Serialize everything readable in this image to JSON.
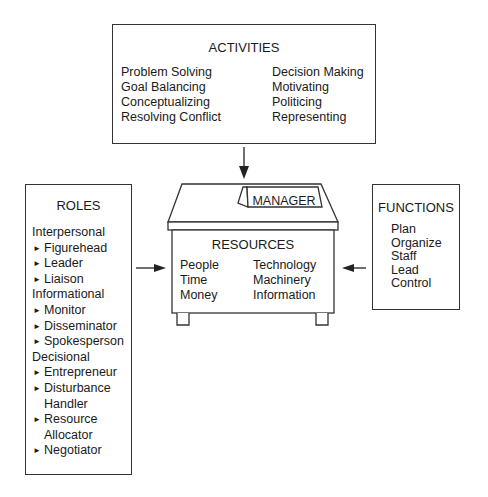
{
  "activities": {
    "title": "ACTIVITIES",
    "left": [
      "Problem Solving",
      "Goal Balancing",
      "Conceptualizing",
      "Resolving Conflict"
    ],
    "right": [
      "Decision Making",
      "Motivating",
      "Politicing",
      "Representing"
    ]
  },
  "manager": {
    "nameplate": "MANAGER",
    "resources_title": "RESOURCES",
    "resources_left": [
      "People",
      "Time",
      "Money"
    ],
    "resources_right": [
      "Technology",
      "Machinery",
      "Information"
    ]
  },
  "roles": {
    "title": "ROLES",
    "groups": [
      {
        "category": "Interpersonal",
        "items": [
          "Figurehead",
          "Leader",
          "Liaison"
        ]
      },
      {
        "category": "Informational",
        "items": [
          "Monitor",
          "Disseminator",
          "Spokesperson"
        ]
      },
      {
        "category": "Decisional",
        "items": [
          "Entrepreneur",
          "Disturbance Handler",
          "Resource Allocator",
          "Negotiator"
        ]
      }
    ],
    "bullet": "►"
  },
  "functions": {
    "title": "FUNCTIONS",
    "items": [
      "Plan",
      "Organize",
      "Staff",
      "Lead",
      "Control"
    ]
  }
}
